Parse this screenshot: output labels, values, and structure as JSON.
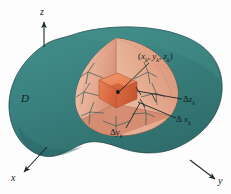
{
  "figure": {
    "colors": {
      "region_fill": "#3a8280",
      "region_fill_dark": "#2f6d6b",
      "wedge_fill": "#e0a288",
      "wedge_fill_light": "#eebfa8",
      "cell_fill": "#e1744e",
      "cell_fill_light": "#ef9a74",
      "outline": "#1d2a2a",
      "label_color": "#14201f",
      "background": "#fdfdfd"
    },
    "axes": [
      {
        "name": "z-axis",
        "label": "z",
        "direction": "up"
      },
      {
        "name": "x-axis",
        "label": "x",
        "direction": "down-left"
      },
      {
        "name": "y-axis",
        "label": "y",
        "direction": "down-right"
      }
    ],
    "labels": {
      "region": "D",
      "z_axis": "z",
      "x_axis": "x",
      "y_axis": "y",
      "point_open": "(",
      "point_x": "x",
      "point_k1": "k",
      "point_comma1": ",",
      "point_y": "y",
      "point_k2": "k",
      "point_comma2": ",",
      "point_z": "z",
      "point_k3": "k",
      "point_close": ")",
      "delta": "Δ",
      "delta_z_var": "z",
      "delta_z_sub": "k",
      "delta_x_var": "x",
      "delta_x_sub": "k",
      "delta_y_var": "y",
      "delta_y_sub": "k"
    }
  }
}
